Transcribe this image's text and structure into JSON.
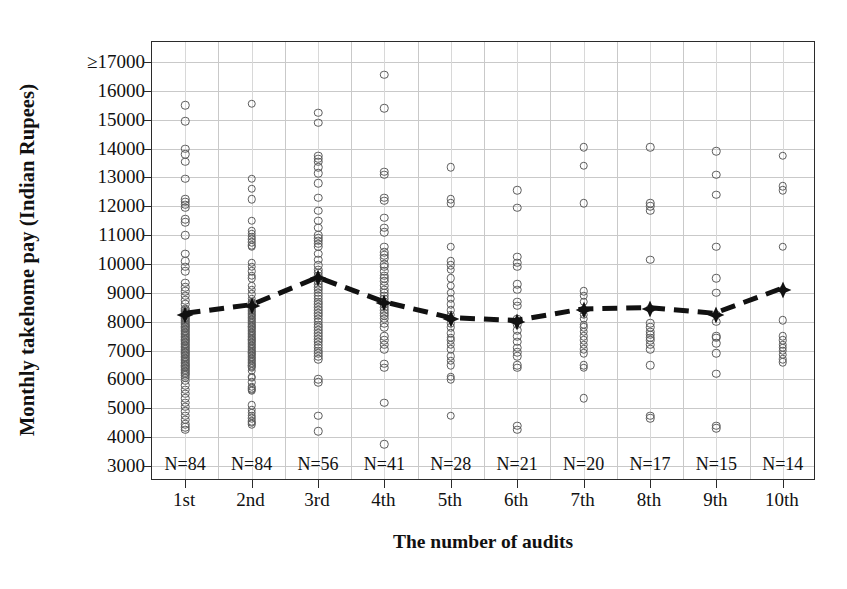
{
  "chart_data": {
    "type": "scatter",
    "title": "",
    "xlabel": "The number of audits",
    "ylabel": "Monthly takehome pay (Indian Rupees)",
    "xlim": [
      0.5,
      10.5
    ],
    "ylim": [
      3000,
      17000
    ],
    "grid": true,
    "legend": null,
    "y_ticks": [
      17000,
      16000,
      15000,
      14000,
      13000,
      12000,
      11000,
      10000,
      9000,
      8000,
      7000,
      6000,
      5000,
      4000,
      3000
    ],
    "y_tick_labels": [
      "≥17000",
      "16000",
      "15000",
      "14000",
      "13000",
      "12000",
      "11000",
      "10000",
      "9000",
      "8000",
      "7000",
      "6000",
      "5000",
      "4000",
      "3000"
    ],
    "categories": [
      "1st",
      "2nd",
      "3rd",
      "4th",
      "5th",
      "6th",
      "7th",
      "8th",
      "9th",
      "10th"
    ],
    "n_labels": [
      "N=84",
      "N=84",
      "N=56",
      "N=41",
      "N=28",
      "N=21",
      "N=20",
      "N=17",
      "N=15",
      "N=14"
    ],
    "counts": [
      84,
      84,
      56,
      41,
      28,
      21,
      20,
      17,
      15,
      14
    ],
    "series": [
      {
        "name": "Mean monthly takehome pay",
        "marker": "filled-diamond",
        "linestyle": "dashed",
        "values": [
          8250,
          8550,
          9500,
          8650,
          8100,
          8000,
          8400,
          8450,
          8250,
          9100
        ]
      }
    ],
    "dot_columns": [
      {
        "category": "1st",
        "values": [
          15500,
          14950,
          14000,
          13800,
          13550,
          12950,
          12250,
          12150,
          12050,
          11950,
          11550,
          11450,
          11000,
          10350,
          10100,
          9900,
          9750,
          9350,
          9200,
          9050,
          8900,
          8750,
          8600,
          8450,
          8400,
          8350,
          8300,
          8250,
          8200,
          8150,
          8100,
          8050,
          8000,
          7950,
          7900,
          7850,
          7800,
          7750,
          7700,
          7650,
          7600,
          7550,
          7500,
          7450,
          7400,
          7350,
          7300,
          7250,
          7200,
          7150,
          7100,
          7050,
          7000,
          6950,
          6900,
          6850,
          6800,
          6750,
          6700,
          6650,
          6600,
          6550,
          6500,
          6450,
          6400,
          6350,
          6300,
          6250,
          6200,
          6150,
          6050,
          5950,
          5800,
          5650,
          5500,
          5350,
          5200,
          5050,
          4900,
          4750,
          4600,
          4450,
          4350,
          4250
        ]
      },
      {
        "category": "2nd",
        "values": [
          15550,
          12950,
          12600,
          12250,
          11500,
          11150,
          11050,
          10950,
          10850,
          10750,
          10650,
          10600,
          10050,
          9900,
          9750,
          9600,
          9500,
          9250,
          9100,
          8950,
          8800,
          8700,
          8650,
          8600,
          8550,
          8500,
          8450,
          8400,
          8350,
          8300,
          8250,
          8200,
          8150,
          8100,
          8050,
          8000,
          7950,
          7900,
          7850,
          7800,
          7750,
          7700,
          7650,
          7600,
          7550,
          7500,
          7450,
          7400,
          7350,
          7300,
          7250,
          7200,
          7150,
          7100,
          7050,
          7000,
          6950,
          6900,
          6850,
          6800,
          6750,
          6700,
          6650,
          6600,
          6550,
          6500,
          6450,
          6400,
          6300,
          6100,
          6050,
          5900,
          5750,
          5700,
          5650,
          5600,
          5100,
          4950,
          4850,
          4750,
          4650,
          4550,
          4500,
          4450
        ]
      },
      {
        "category": "3rd",
        "values": [
          15250,
          14900,
          13750,
          13650,
          13550,
          13350,
          13150,
          12800,
          12300,
          11850,
          11500,
          11250,
          11000,
          10900,
          10800,
          10700,
          10600,
          10350,
          10150,
          9950,
          9800,
          9700,
          9600,
          9500,
          9400,
          9300,
          9200,
          9100,
          9000,
          8900,
          8800,
          8700,
          8600,
          8500,
          8400,
          8300,
          8200,
          8100,
          8000,
          7900,
          7800,
          7700,
          7600,
          7500,
          7400,
          7300,
          7200,
          7100,
          7000,
          6900,
          6800,
          6700,
          6000,
          5900,
          4750,
          4200
        ]
      },
      {
        "category": "4th",
        "values": [
          16550,
          15400,
          13200,
          13100,
          12300,
          12200,
          11600,
          11250,
          11100,
          10600,
          10400,
          10300,
          10200,
          10000,
          9900,
          9750,
          9600,
          9500,
          9400,
          9250,
          9100,
          9000,
          8900,
          8800,
          8700,
          8600,
          8500,
          8400,
          8300,
          8200,
          8100,
          7950,
          7800,
          7500,
          7350,
          7200,
          7050,
          6550,
          6400,
          5200,
          3750
        ]
      },
      {
        "category": "5th",
        "values": [
          13350,
          12250,
          12100,
          10600,
          10100,
          9950,
          9800,
          9500,
          9250,
          9000,
          8800,
          8600,
          8400,
          8250,
          8100,
          7950,
          7800,
          7600,
          7450,
          7350,
          7200,
          7050,
          6800,
          6650,
          6500,
          6100,
          6000,
          4750
        ]
      },
      {
        "category": "6th",
        "values": [
          12550,
          11950,
          10250,
          10050,
          9900,
          9300,
          9100,
          8700,
          8550,
          8100,
          7900,
          7700,
          7500,
          7300,
          7100,
          6950,
          6800,
          6500,
          6400,
          4400,
          4250
        ]
      },
      {
        "category": "7th",
        "values": [
          14050,
          13400,
          12100,
          9050,
          8900,
          8700,
          8400,
          8250,
          8100,
          7900,
          7800,
          7650,
          7500,
          7350,
          7200,
          7050,
          6900,
          6500,
          6400,
          5350
        ]
      },
      {
        "category": "8th",
        "values": [
          14050,
          12100,
          12000,
          11850,
          10150,
          8450,
          7950,
          7800,
          7650,
          7550,
          7450,
          7350,
          7200,
          7050,
          6500,
          4750,
          4650
        ]
      },
      {
        "category": "9th",
        "values": [
          13900,
          13100,
          12400,
          10600,
          8250,
          7500,
          7450,
          7250,
          6900,
          6200,
          4400,
          4300,
          9500,
          9000,
          8000
        ]
      },
      {
        "category": "10th",
        "values": [
          13750,
          12700,
          12550,
          10600,
          9100,
          8050,
          7500,
          7350,
          7200,
          7100,
          7000,
          6850,
          6700,
          6600
        ]
      }
    ]
  }
}
